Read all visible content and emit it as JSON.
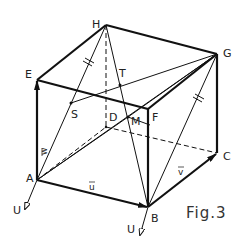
{
  "figure": {
    "caption": "Fig.3",
    "vertices": {
      "A": "A",
      "B": "B",
      "C": "C",
      "D": "D",
      "E": "E",
      "F": "F",
      "G": "G",
      "H": "H"
    },
    "points": {
      "S": "S",
      "T": "T",
      "M": "M"
    },
    "vectors": {
      "u": "u",
      "v": "v",
      "w": "w"
    },
    "origin_labels": {
      "at_A": "U",
      "at_B": "U"
    },
    "colors": {
      "line": "#111111",
      "background": "#ffffff"
    }
  }
}
